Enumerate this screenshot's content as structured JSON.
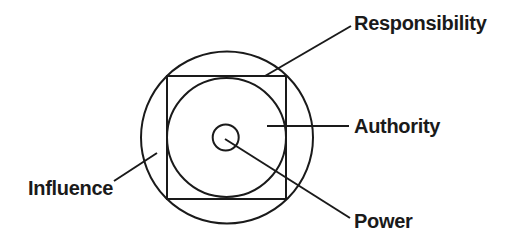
{
  "diagram": {
    "type": "nested-concentric-concept-diagram",
    "layers_outer_to_inner": [
      "Influence",
      "Responsibility",
      "Authority",
      "Power"
    ],
    "labels": {
      "responsibility": "Responsibility",
      "authority": "Authority",
      "influence": "Influence",
      "power": "Power"
    },
    "colors": {
      "stroke": "#1a1a1a",
      "text": "#1a1a1a",
      "background": "#ffffff"
    }
  }
}
